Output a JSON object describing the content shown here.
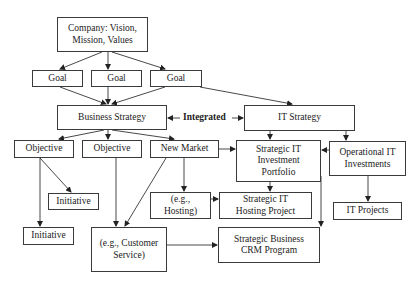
{
  "diagram": {
    "nodes": {
      "company": "Company: Vision, Mission, Values",
      "goal_1": "Goal",
      "goal_2": "Goal",
      "goal_3": "Goal",
      "business_strategy": "Business Strategy",
      "it_strategy": "IT Strategy",
      "objective_1": "Objective",
      "objective_2": "Objective",
      "new_market": "New Market",
      "strategic_it_portfolio": "Strategic IT Investment Portfolio",
      "operational_it": "Operational IT Investments",
      "initiative_1": "Initiative",
      "initiative_2": "Initiative",
      "eg_hosting": "(e.g., Hosting)",
      "strategic_it_hosting": "Strategic IT Hosting Project",
      "it_projects": "IT Projects",
      "eg_customer_service": "(e.g., Customer Service)",
      "strategic_crm": "Strategic Business CRM Program"
    },
    "integrated_label": "Integrated",
    "edges": [
      [
        "company",
        "goal_1"
      ],
      [
        "company",
        "goal_2"
      ],
      [
        "company",
        "goal_3"
      ],
      [
        "goal_1",
        "business_strategy"
      ],
      [
        "goal_2",
        "business_strategy"
      ],
      [
        "goal_3",
        "business_strategy"
      ],
      [
        "goal_3",
        "it_strategy"
      ],
      [
        "business_strategy",
        "it_strategy",
        "integrated (bidirectional)"
      ],
      [
        "business_strategy",
        "objective_1"
      ],
      [
        "business_strategy",
        "objective_2"
      ],
      [
        "business_strategy",
        "new_market"
      ],
      [
        "it_strategy",
        "strategic_it_portfolio"
      ],
      [
        "it_strategy",
        "operational_it"
      ],
      [
        "operational_it",
        "strategic_it_portfolio"
      ],
      [
        "new_market",
        "strategic_it_portfolio"
      ],
      [
        "objective_1",
        "initiative_1"
      ],
      [
        "objective_1",
        "initiative_2"
      ],
      [
        "objective_2",
        "eg_customer_service"
      ],
      [
        "new_market",
        "eg_customer_service"
      ],
      [
        "new_market",
        "eg_hosting"
      ],
      [
        "eg_hosting",
        "strategic_it_hosting"
      ],
      [
        "strategic_it_portfolio",
        "strategic_it_hosting"
      ],
      [
        "strategic_it_portfolio",
        "strategic_crm"
      ],
      [
        "eg_customer_service",
        "strategic_crm"
      ],
      [
        "operational_it",
        "it_projects"
      ]
    ]
  }
}
